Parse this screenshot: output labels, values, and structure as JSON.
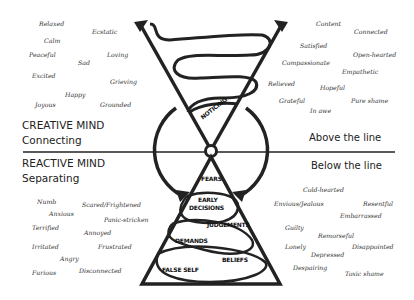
{
  "creative": {
    "title": "CREATIVE MIND",
    "subtitle": "Connecting",
    "line_label": "Above the line"
  },
  "reactive": {
    "title": "REACTIVE MIND",
    "subtitle": "Separating",
    "line_label": "Below the line"
  },
  "funnel": {
    "label": "NOTICING"
  },
  "pyramid": {
    "layers": [
      "FEARS",
      "EARLY",
      "DECISIONS",
      "JUDGEMENTS",
      "DEMANDS",
      "BELIEFS",
      "FALSE SELF"
    ]
  },
  "words_top_left": [
    "Relaxed",
    "Ecstatic",
    "Calm",
    "Peaceful",
    "Loving",
    "Sad",
    "Excited",
    "Grieving",
    "Happy",
    "Joyous",
    "Grounded"
  ],
  "words_top_right": [
    "Content",
    "Connected",
    "Satisfied",
    "Open-hearted",
    "Compassionate",
    "Empathetic",
    "Relieved",
    "Hopeful",
    "Grateful",
    "Pure shame",
    "In awe"
  ],
  "words_bottom_left": [
    "Numb",
    "Scared/Frightened",
    "Anxious",
    "Panic-stricken",
    "Terrified",
    "Annoyed",
    "Irritated",
    "Frustrated",
    "Angry",
    "Furious",
    "Disconnected"
  ],
  "words_bottom_right": [
    "Cold-hearted",
    "Envious/Jealous",
    "Resentful",
    "Embarrassed",
    "Guilty",
    "Remorseful",
    "Lonely",
    "Disappointed",
    "Depressed",
    "Despairing",
    "Toxic shame"
  ]
}
